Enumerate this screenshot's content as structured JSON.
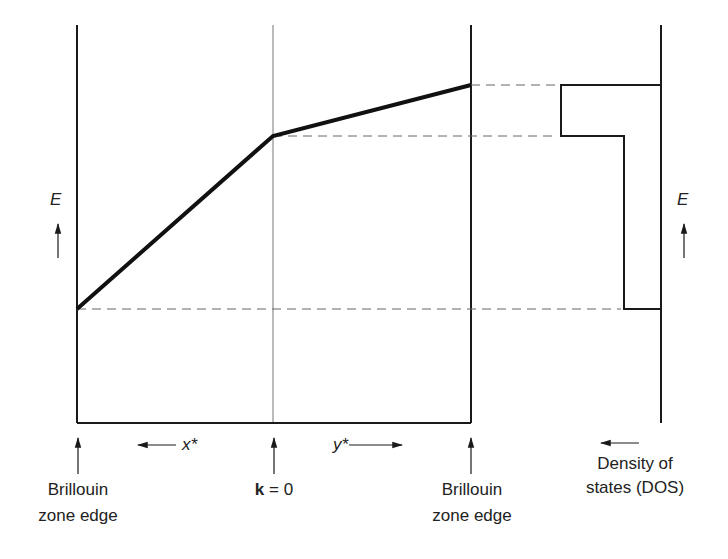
{
  "diagram": {
    "title": "",
    "colors": {
      "ink": "#1a1a1a",
      "dashed": "#555555",
      "background": "#ffffff"
    },
    "energy_axis_left": {
      "label": "E",
      "arrow": "up-arrow"
    },
    "energy_axis_right": {
      "label": "E",
      "arrow": "up-arrow"
    },
    "k_direction_left": {
      "label": "x*",
      "arrow": "left-arrow"
    },
    "k_direction_right": {
      "label": "y*",
      "arrow": "right-arrow"
    },
    "markers": [
      {
        "id": "bz-left",
        "line1": "Brillouin",
        "line2": "zone edge"
      },
      {
        "id": "k0",
        "bold_part": "k",
        "rest": " = 0"
      },
      {
        "id": "bz-right",
        "line1": "Brillouin",
        "line2": "zone edge"
      }
    ],
    "dos": {
      "line1": "Density of",
      "line2": "states (DOS)",
      "arrow": "left-arrow"
    },
    "band": {
      "description": "Piecewise-linear band: steep rise along x* toward k=0, shallow rise along y* to zone edge",
      "points": [
        {
          "position": "Brillouin zone edge (x*)",
          "E_rel": 0.0
        },
        {
          "position": "k = 0",
          "E_rel": 0.77
        },
        {
          "position": "Brillouin zone edge (y*)",
          "E_rel": 1.0
        }
      ]
    },
    "dos_profile": {
      "description": "Step-function DOS: constant low value between lowest energy and k=0 energy, higher value between k=0 energy and top of band, zero outside",
      "levels": [
        {
          "E_range": [
            0.0,
            0.77
          ],
          "dos_rel": 0.37
        },
        {
          "E_range": [
            0.77,
            1.0
          ],
          "dos_rel": 1.0
        }
      ]
    }
  }
}
